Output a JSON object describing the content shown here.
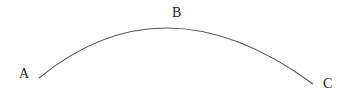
{
  "diagram": {
    "type": "arc",
    "stroke_color": "#555555",
    "label_color": "#222222",
    "points": [
      {
        "label": "A",
        "x": 24,
        "y": 78
      },
      {
        "label": "B",
        "x": 178,
        "y": 17
      },
      {
        "label": "C",
        "x": 328,
        "y": 88
      }
    ]
  }
}
